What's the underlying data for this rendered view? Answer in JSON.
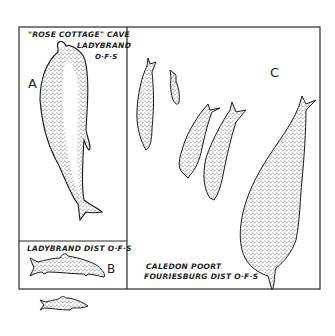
{
  "figure": {
    "panels": [
      {
        "id": "A",
        "letter": "A",
        "caption_line1": "\"ROSE COTTAGE\" CAVE",
        "caption_line2": "LADYBRAND",
        "caption_line3": "O·F·S"
      },
      {
        "id": "B",
        "letter": "B",
        "caption_line1": "LADYBRAND DIST O·F·S"
      },
      {
        "id": "C",
        "letter": "C",
        "caption_line1": "CALEDON POORT",
        "caption_line2": "FOURIESBURG DIST O·F·S"
      }
    ],
    "colors": {
      "ink": "#222222",
      "stipple": "#555555",
      "background": "#ffffff"
    }
  }
}
